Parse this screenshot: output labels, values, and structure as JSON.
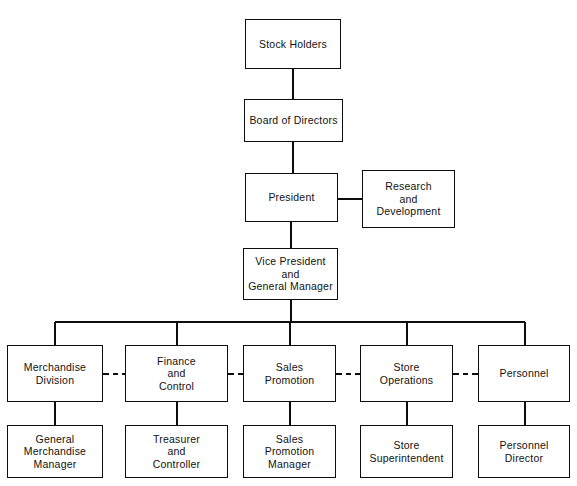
{
  "diagram": {
    "type": "organization-chart",
    "colors": {
      "background": "#ffffff",
      "line": "#0d0d0d",
      "text": "#111111",
      "box_fill": "#ffffff"
    },
    "nodes": [
      {
        "id": "stock-holders",
        "label": "Stock Holders",
        "level": 0,
        "x": 245,
        "y": 19,
        "w": 96,
        "h": 50
      },
      {
        "id": "board-of-directors",
        "label": "Board of Directors",
        "level": 1,
        "x": 244,
        "y": 99,
        "w": 99,
        "h": 43
      },
      {
        "id": "president",
        "label": "President",
        "level": 2,
        "x": 245,
        "y": 173,
        "w": 93,
        "h": 49
      },
      {
        "id": "research-and-development",
        "label": "Research\nand\nDevelopment",
        "level": 2,
        "x": 362,
        "y": 170,
        "w": 93,
        "h": 58
      },
      {
        "id": "vice-president-and-general-manager",
        "label": "Vice President\nand\nGeneral Manager",
        "level": 3,
        "x": 243,
        "y": 248,
        "w": 95,
        "h": 52
      },
      {
        "id": "merchandise-division",
        "label": "Merchandise\nDivision",
        "level": 4,
        "x": 7,
        "y": 345,
        "w": 96,
        "h": 57
      },
      {
        "id": "finance-and-control",
        "label": "Finance\nand\nControl",
        "level": 4,
        "x": 125,
        "y": 345,
        "w": 103,
        "h": 57
      },
      {
        "id": "sales-promotion",
        "label": "Sales\nPromotion",
        "level": 4,
        "x": 243,
        "y": 345,
        "w": 93,
        "h": 57
      },
      {
        "id": "store-operations",
        "label": "Store\nOperations",
        "level": 4,
        "x": 360,
        "y": 345,
        "w": 93,
        "h": 57
      },
      {
        "id": "personnel",
        "label": "Personnel",
        "level": 4,
        "x": 478,
        "y": 345,
        "w": 92,
        "h": 57
      },
      {
        "id": "general-merchandise-manager",
        "label": "General\nMerchandise\nManager",
        "level": 5,
        "x": 7,
        "y": 425,
        "w": 96,
        "h": 53
      },
      {
        "id": "treasurer-and-controller",
        "label": "Treasurer\nand\nController",
        "level": 5,
        "x": 125,
        "y": 425,
        "w": 103,
        "h": 53
      },
      {
        "id": "sales-promotion-manager",
        "label": "Sales\nPromotion\nManager",
        "level": 5,
        "x": 243,
        "y": 425,
        "w": 93,
        "h": 53
      },
      {
        "id": "store-superintendent",
        "label": "Store\nSuperintendent",
        "level": 5,
        "x": 360,
        "y": 425,
        "w": 93,
        "h": 53
      },
      {
        "id": "personnel-director",
        "label": "Personnel\nDirector",
        "level": 5,
        "x": 478,
        "y": 425,
        "w": 92,
        "h": 53
      }
    ],
    "connectors": [
      {
        "id": "stockholders-to-board",
        "from": "stock-holders",
        "to": "board-of-directors",
        "style": "solid",
        "orientation": "vertical"
      },
      {
        "id": "board-to-president",
        "from": "board-of-directors",
        "to": "president",
        "style": "solid",
        "orientation": "vertical"
      },
      {
        "id": "president-to-research",
        "from": "president",
        "to": "research-and-development",
        "style": "solid",
        "orientation": "horizontal"
      },
      {
        "id": "president-to-vice-president",
        "from": "president",
        "to": "vice-president-and-general-manager",
        "style": "solid",
        "orientation": "vertical"
      },
      {
        "id": "vice-president-to-divisions-bus",
        "from": "vice-president-and-general-manager",
        "to": "division-row",
        "style": "solid",
        "orientation": "bus"
      },
      {
        "id": "merchandise-to-general-merchandise-manager",
        "from": "merchandise-division",
        "to": "general-merchandise-manager",
        "style": "solid",
        "orientation": "vertical"
      },
      {
        "id": "finance-to-treasurer",
        "from": "finance-and-control",
        "to": "treasurer-and-controller",
        "style": "solid",
        "orientation": "vertical"
      },
      {
        "id": "sales-promotion-to-manager",
        "from": "sales-promotion",
        "to": "sales-promotion-manager",
        "style": "solid",
        "orientation": "vertical"
      },
      {
        "id": "store-operations-to-superintendent",
        "from": "store-operations",
        "to": "store-superintendent",
        "style": "solid",
        "orientation": "vertical"
      },
      {
        "id": "personnel-to-director",
        "from": "personnel",
        "to": "personnel-director",
        "style": "solid",
        "orientation": "vertical"
      },
      {
        "id": "merchandise-to-finance-dashed",
        "from": "merchandise-division",
        "to": "finance-and-control",
        "style": "dashed",
        "orientation": "horizontal"
      },
      {
        "id": "finance-to-sales-promotion-dashed",
        "from": "finance-and-control",
        "to": "sales-promotion",
        "style": "dashed",
        "orientation": "horizontal"
      },
      {
        "id": "sales-promotion-to-store-operations-dashed",
        "from": "sales-promotion",
        "to": "store-operations",
        "style": "dashed",
        "orientation": "horizontal"
      },
      {
        "id": "store-operations-to-personnel-dashed",
        "from": "store-operations",
        "to": "personnel",
        "style": "dashed",
        "orientation": "horizontal"
      }
    ]
  }
}
